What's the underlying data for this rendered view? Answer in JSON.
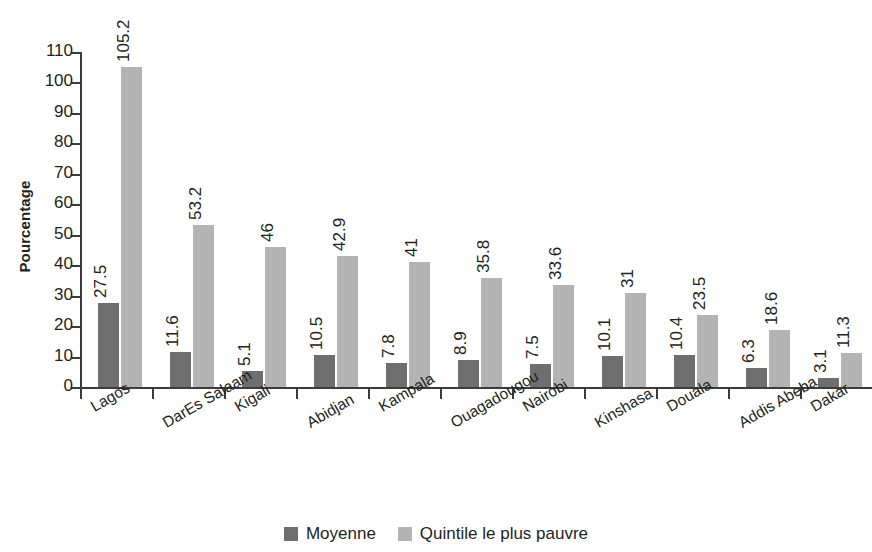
{
  "chart_data": {
    "type": "bar",
    "title": "",
    "subtitle": "",
    "xlabel": "",
    "ylabel": "Pourcentage",
    "ylim": [
      0,
      110
    ],
    "y_ticks": [
      0,
      10,
      20,
      30,
      40,
      50,
      60,
      70,
      80,
      90,
      100,
      110
    ],
    "grid": false,
    "legend_position": "bottom-center",
    "categories": [
      "Lagos",
      "DarEs Salaam",
      "Kigali",
      "Abidjan",
      "Kampala",
      "Ouagadougou",
      "Nairobi",
      "Kinshasa",
      "Douala",
      "Addis Abeba",
      "Dakar"
    ],
    "series": [
      {
        "name": "Moyenne",
        "color": "#6e6e6e",
        "values": [
          27.5,
          11.6,
          5.1,
          10.5,
          7.8,
          8.9,
          7.5,
          10.1,
          10.4,
          6.3,
          3.1
        ],
        "value_labels": [
          "27.5",
          "11.6",
          "5.1",
          "10.5",
          "7.8",
          "8.9",
          "7.5",
          "10.1",
          "10.4",
          "6.3",
          "3.1"
        ]
      },
      {
        "name": "Quintile le plus pauvre",
        "color": "#b3b3b3",
        "values": [
          105.2,
          53.2,
          46,
          42.9,
          41,
          35.8,
          33.6,
          31,
          23.5,
          18.6,
          11.3
        ],
        "value_labels": [
          "105.2",
          "53.2",
          "46",
          "42.9",
          "41",
          "35.8",
          "33.6",
          "31",
          "23.5",
          "18.6",
          "11.3"
        ]
      }
    ]
  },
  "legend": {
    "items": [
      {
        "label": "Moyenne",
        "color": "#6e6e6e"
      },
      {
        "label": "Quintile le plus pauvre",
        "color": "#b3b3b3"
      }
    ]
  },
  "colors": {
    "axis": "#3b3b3b",
    "text": "#231f20",
    "background": "#ffffff",
    "series_dark": "#6e6e6e",
    "series_light": "#b3b3b3"
  }
}
